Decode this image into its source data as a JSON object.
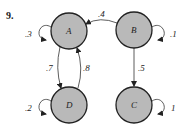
{
  "problem_number": "9.",
  "colors": {
    "node_fill": "#b9b9b9",
    "stroke": "#222222",
    "background": "#ffffff"
  },
  "nodes": [
    {
      "id": "A",
      "label": "A",
      "cx": 69,
      "cy": 31
    },
    {
      "id": "B",
      "label": "B",
      "cx": 134,
      "cy": 30
    },
    {
      "id": "C",
      "label": "C",
      "cx": 134,
      "cy": 105
    },
    {
      "id": "D",
      "label": "D",
      "cx": 69,
      "cy": 105
    }
  ],
  "edges": [
    {
      "from": "A",
      "to": "A",
      "label": ".3"
    },
    {
      "from": "B",
      "to": "B",
      "label": ".1"
    },
    {
      "from": "B",
      "to": "A",
      "label": ".4"
    },
    {
      "from": "B",
      "to": "C",
      "label": ".5"
    },
    {
      "from": "A",
      "to": "D",
      "label": ".7"
    },
    {
      "from": "D",
      "to": "A",
      "label": ".8"
    },
    {
      "from": "D",
      "to": "D",
      "label": ".2"
    },
    {
      "from": "C",
      "to": "C",
      "label": "1"
    }
  ]
}
